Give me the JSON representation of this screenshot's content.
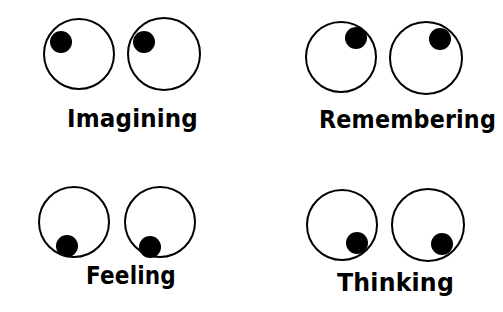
{
  "diagram": {
    "colors": {
      "background": "#ffffff",
      "stroke": "#000000",
      "pupil": "#000000",
      "eye_fill": "#ffffff"
    },
    "panels": [
      {
        "id": "imagining",
        "label": "Imagining",
        "gaze": "up-left",
        "label_pos": {
          "x": 67,
          "y": 107,
          "width": 131
        },
        "eyes": [
          {
            "cx": 79,
            "cy": 54,
            "r": 35,
            "pupil": {
              "cx": 61,
              "cy": 42,
              "r": 11
            }
          },
          {
            "cx": 164,
            "cy": 54,
            "r": 36,
            "pupil": {
              "cx": 144,
              "cy": 42,
              "r": 11
            }
          }
        ]
      },
      {
        "id": "remembering",
        "label": "Remembering",
        "gaze": "up-right",
        "label_pos": {
          "x": 319,
          "y": 108,
          "width": 177
        },
        "eyes": [
          {
            "cx": 341,
            "cy": 57,
            "r": 35,
            "pupil": {
              "cx": 356,
              "cy": 38,
              "r": 11
            }
          },
          {
            "cx": 426,
            "cy": 58,
            "r": 36,
            "pupil": {
              "cx": 440,
              "cy": 39,
              "r": 11
            }
          }
        ]
      },
      {
        "id": "feeling",
        "label": "Feeling",
        "gaze": "down-left",
        "label_pos": {
          "x": 86,
          "y": 264,
          "width": 90
        },
        "eyes": [
          {
            "cx": 74,
            "cy": 222,
            "r": 35,
            "pupil": {
              "cx": 67,
              "cy": 246,
              "r": 11
            }
          },
          {
            "cx": 160,
            "cy": 222,
            "r": 35,
            "pupil": {
              "cx": 150,
              "cy": 247,
              "r": 11
            }
          }
        ]
      },
      {
        "id": "thinking",
        "label": "Thinking",
        "gaze": "down-right",
        "label_pos": {
          "x": 337,
          "y": 271,
          "width": 117
        },
        "eyes": [
          {
            "cx": 342,
            "cy": 225,
            "r": 35,
            "pupil": {
              "cx": 357,
              "cy": 243,
              "r": 11
            }
          },
          {
            "cx": 428,
            "cy": 225,
            "r": 36,
            "pupil": {
              "cx": 442,
              "cy": 244,
              "r": 11
            }
          }
        ]
      }
    ]
  }
}
